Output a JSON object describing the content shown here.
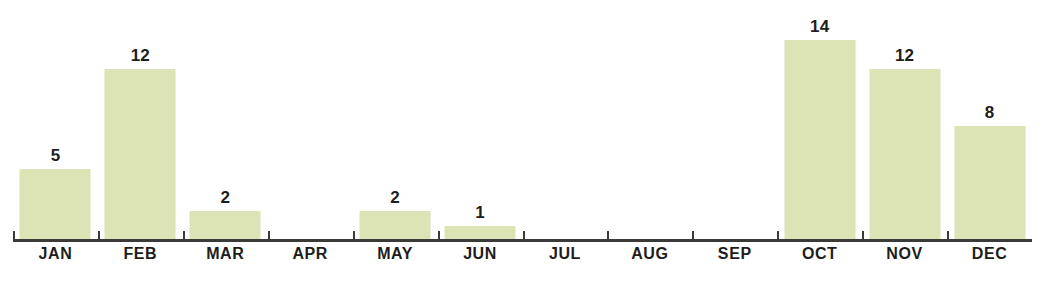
{
  "chart_data": {
    "type": "bar",
    "title": "",
    "subtitle": "",
    "xlabel": "",
    "ylabel": "",
    "categories": [
      "JAN",
      "FEB",
      "MAR",
      "APR",
      "MAY",
      "JUN",
      "JUL",
      "AUG",
      "SEP",
      "OCT",
      "NOV",
      "DEC"
    ],
    "values": [
      5,
      12,
      2,
      0,
      2,
      1,
      0,
      0,
      0,
      14,
      12,
      8
    ],
    "value_labels": [
      "5",
      "12",
      "2",
      "",
      "2",
      "1",
      "",
      "",
      "",
      "14",
      "12",
      "8"
    ],
    "ylim": [
      0,
      15
    ],
    "grid": false,
    "legend": null,
    "annotations": [],
    "bar_color": "#dce4b6",
    "axis_color": "#3a3a38",
    "label_color": "#1d1d1b",
    "background_color": "#ffffff"
  }
}
